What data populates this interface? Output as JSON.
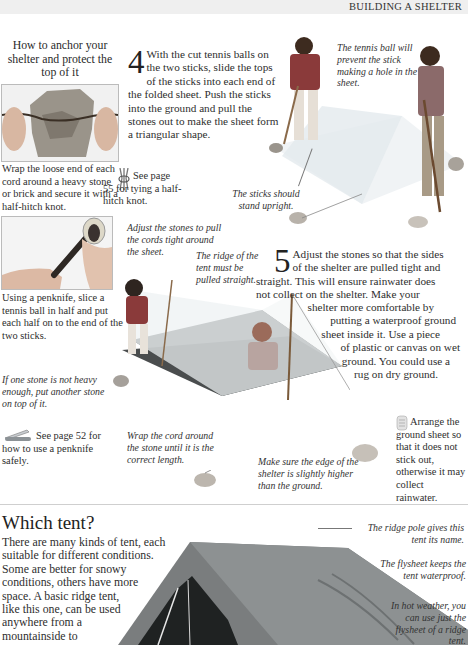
{
  "page": {
    "running_head": "BUILDING A SHELTER"
  },
  "anchor_box": {
    "heading": "How to anchor your shelter and protect the top of it",
    "caption_wrap": "Wrap the loose end of each cord around a heavy stone or brick and secure it with a half-hitch knot.",
    "caption_penknife": "Using a penknife, slice a tennis ball in half and put each half on to the end of the two sticks.",
    "see_knot": "See page 55 for tying a half-hitch knot.",
    "see_penknife": "See page 52 for how to use a penknife safely."
  },
  "step4": {
    "number": "4",
    "text": "With the cut tennis balls on the two sticks, slide the tops of the sticks into each end of the folded sheet. Push the sticks into the ground and pull the stones out to make the sheet form a triangular shape."
  },
  "step5": {
    "number": "5",
    "text_lines": [
      "Adjust the stones so that the sides",
      "of the shelter are pulled tight and",
      "straight. This will ensure rainwater does",
      "not collect on the shelter. Make your",
      "shelter more comfortable by",
      "putting a waterproof ground",
      "sheet inside it. Use a piece",
      "of plastic or canvas on wet",
      "ground. You could use a",
      "rug on dry ground."
    ]
  },
  "annotations": {
    "tennis_ball": "The tennis ball will prevent the stick making a hole in the sheet.",
    "sticks_upright": "The sticks should stand upright.",
    "adjust_stones": "Adjust the stones to pull the cords tight around the sheet.",
    "ridge_straight": "The ridge of the tent must be pulled straight.",
    "one_stone": "If one stone is not heavy enough, put another stone on top of it.",
    "wrap_cord": "Wrap the cord around the stone until it is the correct length.",
    "edge_higher": "Make sure the edge of the shelter is slightly higher than the ground.",
    "ground_sheet": "Arrange the ground sheet so that it does not stick out, otherwise it may collect rainwater."
  },
  "which_tent": {
    "title": "Which tent?",
    "text_lines": [
      "There are many kinds of tent, each",
      "suitable for different conditions.",
      "Some are better for snowy",
      "conditions, others have more",
      "space. A basic ridge tent,",
      "like this one, can be used",
      "anywhere from a",
      "mountainside to"
    ],
    "label_ridge_pole": "The ridge pole gives this tent its name.",
    "label_flysheet": "The flysheet keeps the tent waterproof.",
    "label_hot_weather": "In hot weather, you can use just the flysheet of a ridge tent."
  }
}
